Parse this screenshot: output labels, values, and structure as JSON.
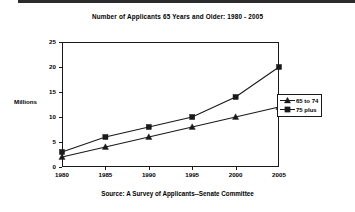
{
  "chart_data": {
    "type": "line",
    "title": "Number of Applicants 65 Years and Older:  1980 - 2005",
    "xlabel": "",
    "ylabel": "Millions",
    "categories": [
      "1980",
      "1985",
      "1990",
      "1995",
      "2000",
      "2005"
    ],
    "x": [
      1980,
      1985,
      1990,
      1995,
      2000,
      2005
    ],
    "series": [
      {
        "name": "65 to 74",
        "marker": "triangle",
        "color": "#1a1a1a",
        "values": [
          2,
          4,
          6,
          8,
          10,
          12
        ]
      },
      {
        "name": "75 plus",
        "marker": "square",
        "color": "#1a1a1a",
        "values": [
          3,
          6,
          8,
          10,
          14,
          20
        ]
      }
    ],
    "ylim": [
      0,
      25
    ],
    "yticks": [
      0,
      5,
      10,
      15,
      20,
      25
    ],
    "ytick_labels": [
      "0",
      "5",
      "10",
      "15",
      "20",
      "25"
    ],
    "xlim": [
      1980,
      2005
    ],
    "grid": false,
    "legend_position": "right",
    "source": "Source: A Survey of Applicants--Senate Committee"
  },
  "legend": {
    "items": [
      {
        "label": "65 to 74"
      },
      {
        "label": "75 plus"
      }
    ]
  }
}
